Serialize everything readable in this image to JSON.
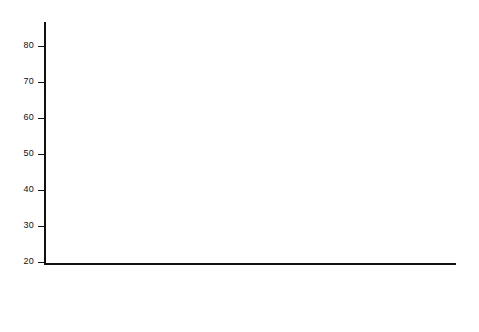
{
  "chart_data": {
    "type": "bar",
    "title": "",
    "subtitle": "",
    "xlabel": "",
    "ylabel": "",
    "ylim": [
      20,
      87
    ],
    "yticks": [
      20,
      30,
      40,
      50,
      60,
      70,
      80
    ],
    "ytick_labels": [
      "20",
      "30",
      "40",
      "50",
      "60",
      "70",
      "80"
    ],
    "grid": false,
    "legend_position": "top-left",
    "legend": [
      {
        "key": "total",
        "label": "Totales conocidos o estimados",
        "fill": "white"
      },
      {
        "key": "hamilton",
        "label": "Totales según E. J. Hamilton",
        "fill": "hatch"
      },
      {
        "key": "foreign",
        "label": "Llegadas de fuera de España",
        "fill": "black"
      }
    ],
    "categories": [
      "1581-85",
      "1586-90",
      "1591-95",
      "1596-1600",
      "1601-05",
      "1606-10",
      "1611-15",
      "1616-20",
      "1621-25",
      "1626-30",
      "1631-35",
      "1636-40",
      "1641-45",
      "1646-50",
      "1651-55",
      "1656-60",
      "1661-65",
      "1665-70",
      "1671-75",
      "1676-80",
      "1681-85",
      "1686-90",
      "1691-95",
      "1696-1700",
      "1701-05",
      "1706-10",
      "1711-15",
      "1716-20"
    ],
    "series": [
      {
        "name": "Totales conocidos o estimados",
        "values": [
          null,
          null,
          62.5,
          null,
          null,
          44.5,
          null,
          55,
          51,
          44.5,
          45,
          45.5,
          44.5,
          29.5,
          49.5,
          85.5,
          69,
          55.5,
          83,
          66.5,
          74,
          68.5,
          66,
          54,
          null,
          null,
          44,
          null
        ]
      },
      {
        "name": "Totales según E. J. Hamilton",
        "values": [
          48,
          39,
          58,
          56,
          40,
          49.5,
          42.5,
          49.5,
          36,
          24,
          28,
          null,
          null,
          null,
          null,
          null,
          null,
          null,
          null,
          null,
          null,
          null,
          null,
          null,
          null,
          null,
          null,
          null
        ]
      },
      {
        "name": "Llegadas de fuera de España",
        "values": [
          null,
          null,
          null,
          null,
          null,
          null,
          null,
          null,
          null,
          null,
          null,
          null,
          null,
          null,
          null,
          null,
          null,
          null,
          null,
          null,
          null,
          null,
          null,
          null,
          38,
          64.5,
          42,
          null
        ]
      }
    ],
    "bars": [
      {
        "category": "1581-85",
        "total": 48,
        "hamilton": 48,
        "foreign": null
      },
      {
        "category": "1586-90",
        "total": 39,
        "hamilton": 39,
        "foreign": null
      },
      {
        "category": "1591-95",
        "total": 58,
        "hamilton": 58,
        "foreign": null
      },
      {
        "category": "1596-1600",
        "total": 62.5,
        "hamilton": 56,
        "foreign": null
      },
      {
        "category": "1601-05",
        "total": 40,
        "hamilton": 40,
        "foreign": null
      },
      {
        "category": "1606-10",
        "total": 49.5,
        "hamilton": 49.5,
        "foreign": null
      },
      {
        "category": "1611-15",
        "total": 44.5,
        "hamilton": 42.5,
        "foreign": null
      },
      {
        "category": "1616-20",
        "total": 49.5,
        "hamilton": 49.5,
        "foreign": null
      },
      {
        "category": "1621-25",
        "total": 55,
        "hamilton": 36,
        "foreign": null
      },
      {
        "category": "1626-30",
        "total": 51,
        "hamilton": 24,
        "foreign": null
      },
      {
        "category": "1631-35",
        "total": 44.5,
        "hamilton": 28,
        "foreign": null
      },
      {
        "category": "1636-40",
        "total": 45,
        "hamilton": null,
        "foreign": null
      },
      {
        "category": "1641-45",
        "total": 45.5,
        "hamilton": null,
        "foreign": null
      },
      {
        "category": "1646-50",
        "total": 44.5,
        "hamilton": null,
        "foreign": null
      },
      {
        "category": "1651-55",
        "total": 29.5,
        "hamilton": null,
        "foreign": null
      },
      {
        "category": "1656-60",
        "total": 49.5,
        "hamilton": null,
        "foreign": null
      },
      {
        "category": "1661-65",
        "total": 85.5,
        "hamilton": null,
        "foreign": null
      },
      {
        "category": "1665-70",
        "total": 69,
        "hamilton": null,
        "foreign": null
      },
      {
        "category": "1671-75",
        "total": 55.5,
        "hamilton": null,
        "foreign": null
      },
      {
        "category": "1676-80",
        "total": 83,
        "hamilton": null,
        "foreign": null
      },
      {
        "category": "1681-85",
        "total": 66.5,
        "hamilton": null,
        "foreign": null
      },
      {
        "category": "1686-90",
        "total": 74,
        "hamilton": null,
        "foreign": null
      },
      {
        "category": "1691-95",
        "total": 68.5,
        "hamilton": null,
        "foreign": null
      },
      {
        "category": "1696-1700",
        "total": 66,
        "hamilton": null,
        "foreign": null
      },
      {
        "category": "1701-05",
        "total": 54,
        "hamilton": null,
        "foreign": 38
      },
      {
        "category": "1706-10",
        "total": 64.5,
        "hamilton": null,
        "foreign": 64.5
      },
      {
        "category": "1711-15",
        "total": 42,
        "hamilton": null,
        "foreign": 42
      },
      {
        "category": "1716-20",
        "total": 44,
        "hamilton": null,
        "foreign": null
      }
    ]
  }
}
